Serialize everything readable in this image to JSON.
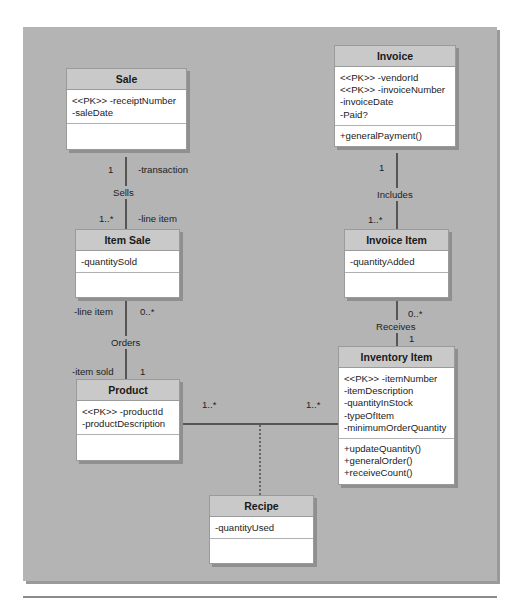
{
  "diagram": {
    "type": "UML class diagram",
    "classes": {
      "sale": {
        "name": "Sale",
        "attributes": [
          "<<PK>> -receiptNumber",
          "-saleDate"
        ],
        "operations": []
      },
      "invoice": {
        "name": "Invoice",
        "attributes": [
          "<<PK>> -vendorId",
          "<<PK>> -invoiceNumber",
          "-invoiceDate",
          "-Paid?"
        ],
        "operations": [
          "+generalPayment()"
        ]
      },
      "item_sale": {
        "name": "Item Sale",
        "attributes": [
          "-quantitySold"
        ],
        "operations": []
      },
      "invoice_item": {
        "name": "Invoice Item",
        "attributes": [
          "-quantityAdded"
        ],
        "operations": []
      },
      "product": {
        "name": "Product",
        "attributes": [
          "<<PK>> -productId",
          "-productDescription"
        ],
        "operations": []
      },
      "inventory_item": {
        "name": "Inventory Item",
        "attributes": [
          "<<PK>> -itemNumber",
          "-itemDescription",
          "-quantityInStock",
          "-typeOfItem",
          "-minimumOrderQuantity"
        ],
        "operations": [
          "+updateQuantity()",
          "+generalOrder()",
          "+receiveCount()"
        ]
      },
      "recipe": {
        "name": "Recipe",
        "attributes": [
          "-quantityUsed"
        ],
        "operations": []
      }
    },
    "associations": {
      "sells": {
        "name": "Sells",
        "from_mult": "1",
        "from_role": "-transaction",
        "to_mult": "1..*",
        "to_role": "-line item"
      },
      "includes": {
        "name": "Includes",
        "from_mult": "1",
        "to_mult": "1..*"
      },
      "orders": {
        "name": "Orders",
        "from_role": "-line item",
        "from_mult": "0..*",
        "to_role": "-item sold",
        "to_mult": "1"
      },
      "receives": {
        "name": "Receives",
        "from_mult": "0..*",
        "to_mult": "1"
      },
      "product_inventory": {
        "left_mult": "1..*",
        "right_mult": "1..*",
        "association_class": "Recipe"
      }
    }
  }
}
